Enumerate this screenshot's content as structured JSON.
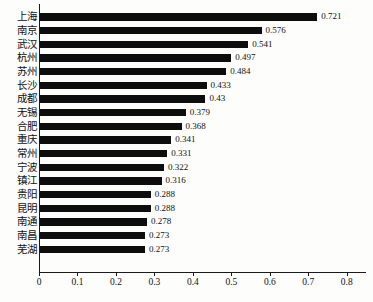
{
  "chart_data": {
    "type": "bar",
    "orientation": "horizontal",
    "title": "",
    "subtitle": "",
    "xlabel": "",
    "ylabel": "",
    "xlim": [
      0,
      0.85
    ],
    "ticks": [
      "0",
      "0.1",
      "0.2",
      "0.3",
      "0.4",
      "0.5",
      "0.6",
      "0.7",
      "0.8"
    ],
    "tick_values": [
      0,
      0.1,
      0.2,
      0.3,
      0.4,
      0.5,
      0.6,
      0.7,
      0.8
    ],
    "grid": false,
    "legend": null,
    "bar_color": "#0d0d0d",
    "background_color": "#fdfdfc",
    "axis_color": "#1a1a1a",
    "categories": [
      "上海",
      "南京",
      "武汉",
      "杭州",
      "苏州",
      "长沙",
      "成都",
      "无锡",
      "合肥",
      "重庆",
      "常州",
      "宁波",
      "镇江",
      "贵阳",
      "昆明",
      "南通",
      "南昌",
      "芜湖"
    ],
    "values": [
      0.721,
      0.576,
      0.541,
      0.497,
      0.484,
      0.433,
      0.43,
      0.379,
      0.368,
      0.341,
      0.331,
      0.322,
      0.316,
      0.288,
      0.288,
      0.278,
      0.273,
      0.273
    ],
    "value_labels": [
      "0.721",
      "0.576",
      "0.541",
      "0.497",
      "0.484",
      "0.433",
      "0.43",
      "0.379",
      "0.368",
      "0.341",
      "0.331",
      "0.322",
      "0.316",
      "0.288",
      "0.288",
      "0.278",
      "0.273",
      "0.273"
    ]
  }
}
